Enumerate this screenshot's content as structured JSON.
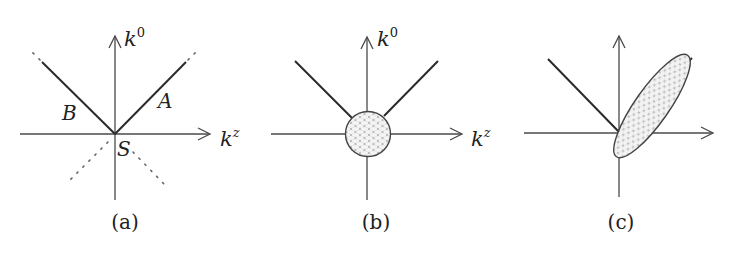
{
  "figure": {
    "panels": [
      {
        "id": "a",
        "caption": "(a)",
        "axis_labels": {
          "vertical": "k",
          "vertical_sup": "0",
          "horizontal": "k",
          "horizontal_sup": "z"
        },
        "line_labels": {
          "left": "B",
          "right": "A",
          "origin": "S"
        },
        "description": "Light-cone lines A and B meeting at origin S; dotted continuations beyond"
      },
      {
        "id": "b",
        "caption": "(b)",
        "axis_labels": {
          "vertical": "k",
          "vertical_sup": "0",
          "horizontal": "k",
          "horizontal_sup": "z"
        },
        "description": "Light-cone lines with hatched circular blob at origin"
      },
      {
        "id": "c",
        "caption": "(c)",
        "description": "Left light-cone line plus hatched elongated ellipse along right line"
      }
    ]
  }
}
